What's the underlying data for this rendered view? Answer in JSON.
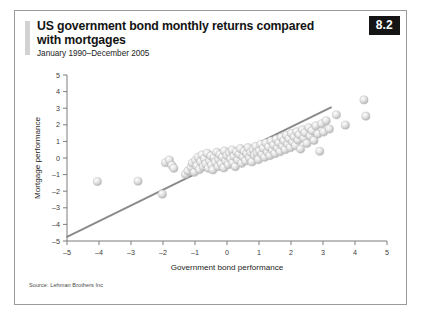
{
  "figure": {
    "badge": "8.2",
    "title": "US government bond monthly returns compared with mortgages",
    "subtitle": "January 1990–December 2005",
    "source": "Source: Lehman Brothers Inc"
  },
  "colors": {
    "badge_background": "#151515",
    "badge_text": "#ffffff",
    "accent_bar": "#d2d2d2",
    "frame_border": "#9a9a9a",
    "point_fill": "#e2e2e2",
    "point_stroke": "#b6b6b6",
    "trend_line": "#8a8a8a",
    "axis": "#7d7d7d",
    "background": "#ffffff"
  },
  "chart_data": {
    "type": "scatter",
    "title": "US government bond monthly returns compared with mortgages",
    "subtitle": "January 1990–December 2005",
    "xlabel": "Government bond performance",
    "ylabel": "Mortgage performance",
    "xlim": [
      -5,
      5
    ],
    "ylim": [
      -5,
      5
    ],
    "xticks": [
      -5,
      -4,
      -3,
      -2,
      -1,
      0,
      1,
      2,
      3,
      4,
      5
    ],
    "yticks": [
      -5,
      -4,
      -3,
      -2,
      -1,
      0,
      1,
      2,
      3,
      4,
      5
    ],
    "xticklabels": [
      "–5",
      "–4",
      "–3",
      "–2",
      "–1",
      "0",
      "1",
      "2",
      "3",
      "4",
      "5"
    ],
    "yticklabels": [
      "–5",
      "–4",
      "–3",
      "–2",
      "–1",
      "0",
      "1",
      "2",
      "3",
      "4",
      "5"
    ],
    "grid": false,
    "legend": false,
    "trend_line": {
      "label": "regression line",
      "x": [
        -5.0,
        3.25
      ],
      "y": [
        -4.75,
        3.05
      ]
    },
    "series": [
      {
        "name": "Monthly returns",
        "marker": "sphere",
        "points": [
          [
            -4.05,
            -1.42
          ],
          [
            -2.78,
            -1.4
          ],
          [
            -2.02,
            -2.18
          ],
          [
            -1.92,
            -0.28
          ],
          [
            -1.8,
            -0.12
          ],
          [
            -1.72,
            -0.45
          ],
          [
            -1.66,
            -0.62
          ],
          [
            -1.3,
            -0.98
          ],
          [
            -1.22,
            -0.78
          ],
          [
            -1.12,
            -0.55
          ],
          [
            -1.08,
            -0.3
          ],
          [
            -1.02,
            -0.86
          ],
          [
            -0.98,
            -0.14
          ],
          [
            -0.94,
            -0.48
          ],
          [
            -0.9,
            0.05
          ],
          [
            -0.86,
            -0.7
          ],
          [
            -0.82,
            -0.22
          ],
          [
            -0.78,
            0.18
          ],
          [
            -0.74,
            -0.52
          ],
          [
            -0.7,
            -0.05
          ],
          [
            -0.66,
            -0.36
          ],
          [
            -0.62,
            0.28
          ],
          [
            -0.58,
            -0.62
          ],
          [
            -0.54,
            -0.18
          ],
          [
            -0.5,
            0.12
          ],
          [
            -0.48,
            -0.42
          ],
          [
            -0.44,
            -0.72
          ],
          [
            -0.4,
            0.02
          ],
          [
            -0.36,
            -0.26
          ],
          [
            -0.32,
            0.34
          ],
          [
            -0.28,
            -0.52
          ],
          [
            -0.26,
            -0.08
          ],
          [
            -0.22,
            0.2
          ],
          [
            -0.18,
            -0.34
          ],
          [
            -0.14,
            0.06
          ],
          [
            -0.1,
            -0.6
          ],
          [
            -0.08,
            0.42
          ],
          [
            -0.04,
            -0.16
          ],
          [
            0.0,
            0.14
          ],
          [
            0.04,
            -0.4
          ],
          [
            0.08,
            0.3
          ],
          [
            0.12,
            -0.06
          ],
          [
            0.16,
            0.48
          ],
          [
            0.18,
            -0.28
          ],
          [
            0.22,
            0.1
          ],
          [
            0.26,
            -0.52
          ],
          [
            0.3,
            0.36
          ],
          [
            0.34,
            -0.12
          ],
          [
            0.38,
            0.22
          ],
          [
            0.42,
            0.56
          ],
          [
            0.46,
            -0.32
          ],
          [
            0.5,
            0.08
          ],
          [
            0.54,
            0.4
          ],
          [
            0.58,
            -0.18
          ],
          [
            0.62,
            0.26
          ],
          [
            0.66,
            0.62
          ],
          [
            0.7,
            0.02
          ],
          [
            0.74,
            0.34
          ],
          [
            0.78,
            -0.24
          ],
          [
            0.82,
            0.5
          ],
          [
            0.86,
            0.16
          ],
          [
            0.9,
            0.7
          ],
          [
            0.94,
            0.3
          ],
          [
            0.98,
            -0.1
          ],
          [
            1.02,
            0.44
          ],
          [
            1.06,
            0.82
          ],
          [
            1.1,
            0.22
          ],
          [
            1.14,
            0.58
          ],
          [
            1.18,
            0.04
          ],
          [
            1.22,
            0.9
          ],
          [
            1.26,
            0.36
          ],
          [
            1.3,
            0.66
          ],
          [
            1.34,
            0.14
          ],
          [
            1.38,
            1.02
          ],
          [
            1.42,
            0.48
          ],
          [
            1.46,
            0.78
          ],
          [
            1.5,
            0.26
          ],
          [
            1.54,
            1.12
          ],
          [
            1.58,
            0.6
          ],
          [
            1.62,
            0.92
          ],
          [
            1.66,
            0.38
          ],
          [
            1.7,
            1.24
          ],
          [
            1.74,
            0.72
          ],
          [
            1.78,
            1.04
          ],
          [
            1.82,
            0.5
          ],
          [
            1.86,
            1.36
          ],
          [
            1.9,
            0.84
          ],
          [
            1.94,
            1.16
          ],
          [
            1.98,
            0.62
          ],
          [
            2.02,
            1.48
          ],
          [
            2.06,
            0.96
          ],
          [
            2.1,
            1.28
          ],
          [
            2.14,
            0.74
          ],
          [
            2.18,
            1.58
          ],
          [
            2.22,
            1.08
          ],
          [
            2.26,
            1.4
          ],
          [
            2.3,
            0.54
          ],
          [
            2.36,
            1.7
          ],
          [
            2.4,
            1.2
          ],
          [
            2.44,
            1.52
          ],
          [
            2.5,
            0.88
          ],
          [
            2.56,
            1.82
          ],
          [
            2.6,
            1.32
          ],
          [
            2.66,
            1.64
          ],
          [
            2.72,
            1.06
          ],
          [
            2.78,
            1.94
          ],
          [
            2.84,
            1.44
          ],
          [
            2.9,
            0.4
          ],
          [
            2.96,
            2.06
          ],
          [
            3.02,
            1.56
          ],
          [
            3.1,
            2.24
          ],
          [
            3.2,
            1.74
          ],
          [
            3.42,
            2.6
          ],
          [
            3.7,
            1.98
          ],
          [
            4.28,
            3.5
          ],
          [
            4.34,
            2.52
          ]
        ]
      }
    ]
  }
}
